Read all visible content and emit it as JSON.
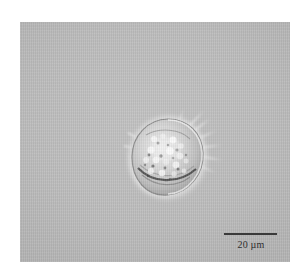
{
  "figure": {
    "kind": "light-microscopy-micrograph",
    "background_color": "#bcbcbc",
    "border_color": "#ffffff"
  },
  "micrograph": {
    "field_label": "microscopy-field",
    "organism_label": "dinoflagellate-cell",
    "features": [
      "granular cytoplasmic inclusions",
      "bright refractile halo",
      "dark ventral girdle arc",
      "radiating apical spines"
    ]
  },
  "scale_bar": {
    "label": "20 µm",
    "value": 20,
    "unit": "µm",
    "bar_color": "#3a3a3a",
    "text_color": "#2e2e2e",
    "length_px": 53
  }
}
